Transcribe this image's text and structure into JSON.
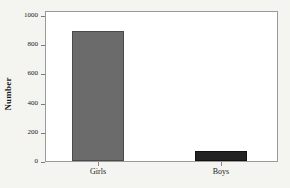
{
  "chart_data": {
    "type": "bar",
    "title": "",
    "subtitle": "",
    "xlabel": "",
    "ylabel": "Number",
    "categories": [
      "Girls",
      "Boys"
    ],
    "values": [
      875,
      65
    ],
    "series": [
      {
        "name": "Number",
        "values": [
          875,
          65
        ]
      }
    ],
    "ylim": [
      0,
      1000
    ],
    "yticks": [
      0,
      200,
      400,
      600,
      800,
      1000
    ],
    "ytick_labels": [
      "0",
      "200",
      "400",
      "600",
      "800",
      "1000"
    ],
    "grid": false,
    "legend": false,
    "legend_position": "none",
    "bar_colors": [
      "#6b6b6b",
      "#232323"
    ],
    "plot_background": "#ffffff",
    "figure_background": "#f4f4f1",
    "frame_color": "#9a9a9a",
    "text_color": "#1b1b1b"
  }
}
